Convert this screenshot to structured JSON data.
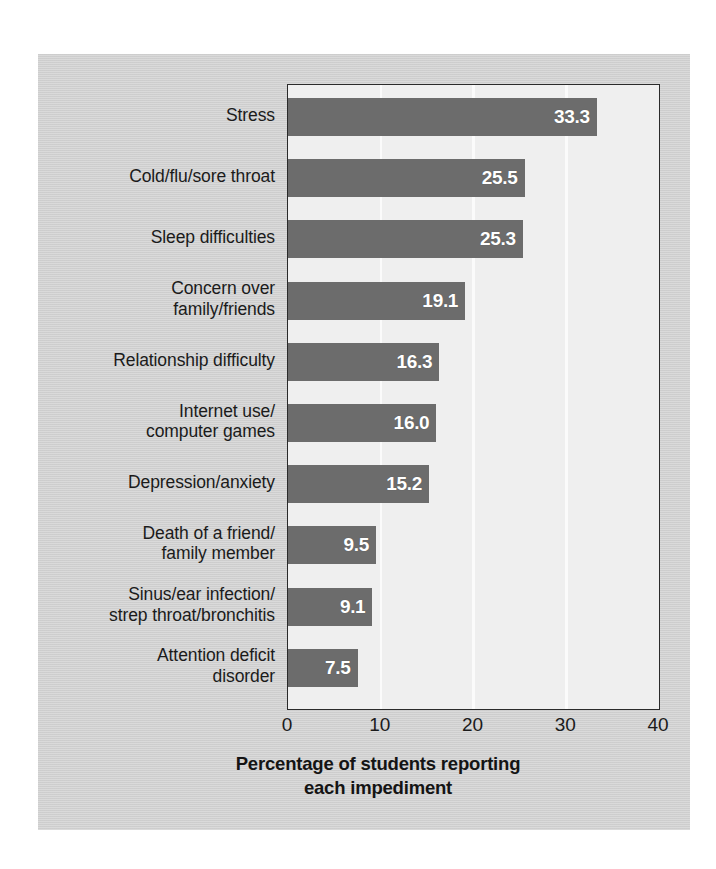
{
  "chart_data": {
    "type": "bar",
    "orientation": "horizontal",
    "title": "",
    "xlabel": "Percentage of students reporting\neach impediment",
    "ylabel": "",
    "xlim": [
      0,
      40
    ],
    "xticks": [
      0,
      10,
      20,
      30,
      40
    ],
    "xtick_labels": [
      "0",
      "10",
      "20",
      "30",
      "40"
    ],
    "grid": true,
    "grid_axis": "x",
    "legend": false,
    "categories": [
      "Stress",
      "Cold/flu/sore throat",
      "Sleep difficulties",
      "Concern over\nfamily/friends",
      "Relationship difficulty",
      "Internet use/\ncomputer games",
      "Depression/anxiety",
      "Death of a friend/\nfamily member",
      "Sinus/ear infection/\nstrep throat/bronchitis",
      "Attention deficit\ndisorder"
    ],
    "values": [
      33.3,
      25.5,
      25.3,
      19.1,
      16.3,
      16.0,
      15.2,
      9.5,
      9.1,
      7.5
    ],
    "value_labels": [
      "33.3",
      "25.5",
      "25.3",
      "19.1",
      "16.3",
      "16.0",
      "15.2",
      "9.5",
      "9.1",
      "7.5"
    ],
    "colors": {
      "bar": "#6c6c6c",
      "bar_label_text": "#ffffff",
      "plot_background": "#efefef",
      "figure_background": "#d4d4d4",
      "gridline": "#fbfbfb",
      "axis_line": "#2a2a2a",
      "text": "#1b1b1b"
    }
  }
}
